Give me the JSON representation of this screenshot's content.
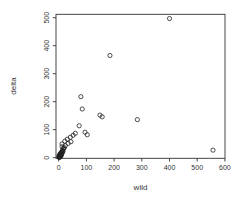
{
  "figure": {
    "background": "#ffffff",
    "axis_color": "#333333"
  },
  "chart_data": {
    "type": "scatter",
    "title": "",
    "xlabel": "wild",
    "ylabel": "delta",
    "xlim": [
      -10,
      600
    ],
    "ylim": [
      -5,
      512
    ],
    "xticks": [
      0,
      100,
      200,
      300,
      400,
      500,
      600
    ],
    "yticks": [
      0,
      100,
      200,
      300,
      400,
      500
    ],
    "grid": false,
    "legend": "none",
    "marker": "open-circle",
    "marker_color": "#222222",
    "axis_color": "#333333",
    "points": [
      [
        400,
        497
      ],
      [
        185,
        365
      ],
      [
        80,
        218
      ],
      [
        85,
        174
      ],
      [
        149,
        152
      ],
      [
        157,
        146
      ],
      [
        284,
        136
      ],
      [
        74,
        114
      ],
      [
        95,
        91
      ],
      [
        103,
        82
      ],
      [
        557,
        27
      ],
      [
        12,
        39
      ],
      [
        24,
        43
      ],
      [
        34,
        51
      ],
      [
        44,
        57
      ],
      [
        12,
        49
      ],
      [
        22,
        59
      ],
      [
        31,
        66
      ],
      [
        42,
        73
      ],
      [
        52,
        80
      ],
      [
        60,
        87
      ],
      [
        1,
        1
      ],
      [
        1,
        4
      ],
      [
        2,
        2
      ],
      [
        2,
        7
      ],
      [
        3,
        4
      ],
      [
        3,
        10
      ],
      [
        4,
        2
      ],
      [
        4,
        7
      ],
      [
        5,
        5
      ],
      [
        5,
        12
      ],
      [
        6,
        8
      ],
      [
        6,
        15
      ],
      [
        7,
        4
      ],
      [
        7,
        11
      ],
      [
        8,
        9
      ],
      [
        8,
        17
      ],
      [
        9,
        13
      ],
      [
        10,
        10
      ],
      [
        10,
        19
      ],
      [
        11,
        15
      ],
      [
        12,
        22
      ],
      [
        13,
        18
      ],
      [
        14,
        26
      ],
      [
        15,
        22
      ],
      [
        16,
        30
      ],
      [
        18,
        33
      ],
      [
        20,
        36
      ]
    ]
  }
}
